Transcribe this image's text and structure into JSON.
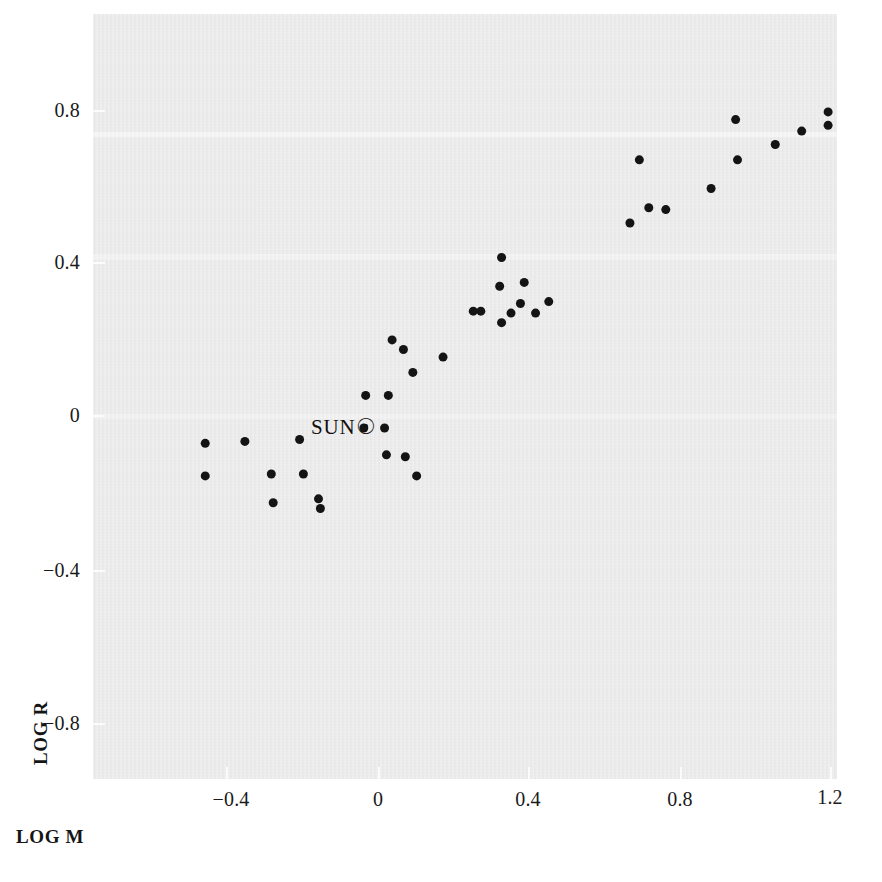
{
  "figure": {
    "background_color": "#ffffff",
    "panel_color": "#ebebeb",
    "marker_color": "#141414"
  },
  "axes": {
    "x_title": "LOG M",
    "y_title": "LOG R",
    "x_ticks": [
      "−0.4",
      "0",
      "0.4",
      "0.8",
      "1.2"
    ],
    "y_ticks": [
      "0.8",
      "0.4",
      "0",
      "−0.4",
      "−0.8"
    ]
  },
  "annotations": {
    "sun_label": "SUN",
    "sun_symbol": "☉"
  },
  "chart_data": {
    "type": "scatter",
    "title": "",
    "xlabel": "LOG M",
    "ylabel": "LOG R",
    "xlim": [
      -0.49,
      1.22
    ],
    "ylim": [
      -0.96,
      0.9
    ],
    "x_ticks": [
      -0.4,
      0,
      0.4,
      0.8,
      1.2
    ],
    "y_ticks": [
      0.8,
      0.4,
      0,
      -0.4,
      -0.8
    ],
    "grid": false,
    "legend": null,
    "marker": "filled-circle",
    "marker_size_px": 9,
    "annotations": [
      {
        "label": "SUN",
        "symbol": "☉",
        "x": 0.0,
        "y": -0.03
      }
    ],
    "points": [
      {
        "x": -0.455,
        "y": -0.07
      },
      {
        "x": -0.455,
        "y": -0.155
      },
      {
        "x": -0.35,
        "y": -0.065
      },
      {
        "x": -0.28,
        "y": -0.15
      },
      {
        "x": -0.275,
        "y": -0.225
      },
      {
        "x": -0.205,
        "y": -0.06
      },
      {
        "x": -0.195,
        "y": -0.15
      },
      {
        "x": -0.155,
        "y": -0.215
      },
      {
        "x": -0.15,
        "y": -0.24
      },
      {
        "x": -0.035,
        "y": -0.03
      },
      {
        "x": -0.03,
        "y": 0.055
      },
      {
        "x": 0.02,
        "y": -0.03
      },
      {
        "x": 0.03,
        "y": 0.055
      },
      {
        "x": 0.025,
        "y": -0.1
      },
      {
        "x": 0.075,
        "y": -0.105
      },
      {
        "x": 0.04,
        "y": 0.2
      },
      {
        "x": 0.07,
        "y": 0.175
      },
      {
        "x": 0.095,
        "y": 0.115
      },
      {
        "x": 0.105,
        "y": -0.155
      },
      {
        "x": 0.175,
        "y": 0.155
      },
      {
        "x": 0.255,
        "y": 0.275
      },
      {
        "x": 0.275,
        "y": 0.275
      },
      {
        "x": 0.33,
        "y": 0.415
      },
      {
        "x": 0.325,
        "y": 0.34
      },
      {
        "x": 0.33,
        "y": 0.245
      },
      {
        "x": 0.355,
        "y": 0.27
      },
      {
        "x": 0.38,
        "y": 0.295
      },
      {
        "x": 0.39,
        "y": 0.35
      },
      {
        "x": 0.42,
        "y": 0.27
      },
      {
        "x": 0.455,
        "y": 0.3
      },
      {
        "x": 0.67,
        "y": 0.505
      },
      {
        "x": 0.695,
        "y": 0.67
      },
      {
        "x": 0.72,
        "y": 0.545
      },
      {
        "x": 0.765,
        "y": 0.54
      },
      {
        "x": 0.885,
        "y": 0.595
      },
      {
        "x": 0.95,
        "y": 0.775
      },
      {
        "x": 0.955,
        "y": 0.67
      },
      {
        "x": 1.055,
        "y": 0.71
      },
      {
        "x": 1.125,
        "y": 0.745
      },
      {
        "x": 1.195,
        "y": 0.795
      },
      {
        "x": 1.195,
        "y": 0.76
      }
    ]
  }
}
